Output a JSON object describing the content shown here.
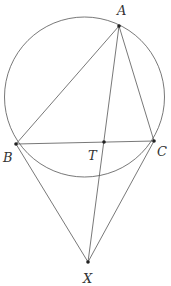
{
  "diagram": {
    "type": "geometry",
    "colors": {
      "stroke": "#555555",
      "point": "#222222",
      "label": "#333333",
      "background": "#ffffff"
    },
    "circle": {
      "cx": 84.5,
      "cy": 97,
      "r": 80
    },
    "points": {
      "A": {
        "label": "A",
        "x": 119,
        "y": 26,
        "label_x": 117,
        "label_y": 15
      },
      "B": {
        "label": "B",
        "x": 16,
        "y": 144,
        "label_x": 3,
        "label_y": 162
      },
      "C": {
        "label": "C",
        "x": 154,
        "y": 141,
        "label_x": 157,
        "label_y": 156
      },
      "T": {
        "label": "T",
        "x": 104,
        "y": 142,
        "label_x": 88,
        "label_y": 160
      },
      "X": {
        "label": "X",
        "x": 88,
        "y": 262,
        "label_x": 83,
        "label_y": 283
      }
    },
    "segments": [
      [
        "A",
        "B"
      ],
      [
        "A",
        "C"
      ],
      [
        "B",
        "C"
      ],
      [
        "A",
        "X"
      ],
      [
        "B",
        "X"
      ],
      [
        "C",
        "X"
      ]
    ]
  }
}
